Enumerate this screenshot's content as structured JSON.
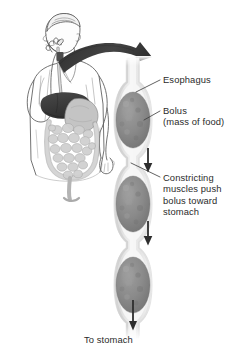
{
  "diagram": {
    "type": "anatomical-illustration",
    "background_color": "#ffffff",
    "text_color": "#2b2b2b",
    "tube_wall_color": "#e8e8e8",
    "tube_lumen_color": "#f4f4f4",
    "bolus_color": "#8a8a8a",
    "arrow_color": "#3a3a3a",
    "swallow_arrow_color": "#3d3d3d",
    "liver_color": "#4a4a4a",
    "intestine_color": "#c9c9c9",
    "outline_color": "#555555"
  },
  "labels": {
    "esophagus": "Esophagus",
    "bolus": "Bolus",
    "bolus_sub": "(mass of food)",
    "constricting": "Constricting\nmuscles push\nbolus toward\nstomach",
    "to_stomach": "To stomach"
  },
  "figure_parts": {
    "person": "person-eating",
    "liver": "liver",
    "stomach": "stomach",
    "intestines": "intestines",
    "swallow_arrow": "swallow-direction-arrow",
    "esophagus_tube": "esophagus-tube",
    "boluses": [
      "bolus-upper",
      "bolus-middle",
      "bolus-lower"
    ],
    "direction_arrows": [
      "peristalsis-arrow-1",
      "peristalsis-arrow-2",
      "to-stomach-arrow"
    ],
    "leader_lines": [
      "leader-esophagus",
      "leader-bolus",
      "leader-constricting"
    ]
  }
}
